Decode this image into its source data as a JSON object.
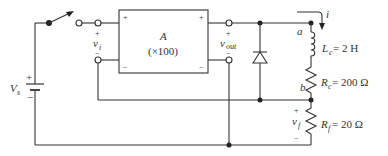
{
  "diagram": {
    "type": "circuit",
    "source": {
      "label": "V",
      "subscript": "s",
      "plus": "+",
      "minus": "−"
    },
    "amplifier": {
      "name": "A",
      "gain": "(×100)",
      "in_plus": "+",
      "in_minus": "−",
      "out_plus": "+",
      "out_minus": "−"
    },
    "input_voltage": {
      "label": "v",
      "subscript": "i",
      "plus": "+",
      "minus": "−"
    },
    "output_voltage": {
      "label": "v",
      "subscript": "out",
      "plus": "+",
      "minus": "−"
    },
    "current": {
      "label": "i"
    },
    "nodes": {
      "a": "a",
      "b": "b"
    },
    "inductor": {
      "label": "L",
      "subscript": "c",
      "value": " = 2 H"
    },
    "coil_resistor": {
      "label": "R",
      "subscript": "c",
      "value": " = 200 Ω"
    },
    "feedback_resistor": {
      "label": "R",
      "subscript": "f",
      "value": " = 20 Ω"
    },
    "feedback_voltage": {
      "label": "v",
      "subscript": "f",
      "plus": "+",
      "minus": "−"
    }
  }
}
